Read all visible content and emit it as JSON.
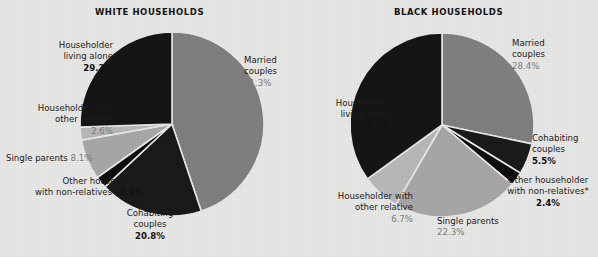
{
  "figure": {
    "footnote_marker": "*"
  },
  "colors": {
    "background": "#e8e8e6",
    "married": "#808080",
    "cohabiting": "#1a1a1a",
    "other_nonrelatives": "#0d0d0d",
    "single_parents": "#a8a8a8",
    "other_relative": "#b9b9b9",
    "living_alone": "#151515",
    "text": "#1c1c1c",
    "muted_text": "#7d7d7d"
  },
  "charts": [
    {
      "id": "white-households",
      "title": "WHITE HOUSEHOLDS",
      "labels": [
        {
          "key": "living-alone",
          "lines": [
            "Householder",
            "living alone"
          ],
          "value": "29.2%",
          "muted": false
        },
        {
          "key": "other-relative",
          "lines": [
            "Householder with",
            "other relative"
          ],
          "value": "2.6%",
          "muted": true
        },
        {
          "key": "single-parents",
          "lines": [
            "Single parents"
          ],
          "value": "8.1%",
          "muted": true,
          "inline": true
        },
        {
          "key": "other-nonrelatives",
          "lines": [
            "Other householder",
            "with non-relatives*"
          ],
          "value": "2.4%",
          "muted": false,
          "inline": true
        },
        {
          "key": "cohabiting",
          "lines": [
            "Cohabiting",
            "couples"
          ],
          "value": "20.8%",
          "muted": false
        },
        {
          "key": "married",
          "lines": [
            "Married",
            "couples"
          ],
          "value": "51.3%",
          "muted": true
        }
      ]
    },
    {
      "id": "black-households",
      "title": "BLACK HOUSEHOLDS",
      "labels": [
        {
          "key": "married",
          "lines": [
            "Married",
            "couples"
          ],
          "value": "28.4%",
          "muted": true
        },
        {
          "key": "cohabiting",
          "lines": [
            "Cohabiting",
            "couples"
          ],
          "value": "5.5%",
          "muted": false
        },
        {
          "key": "other-nonrelatives",
          "lines": [
            "Other householder",
            "with non-relatives*"
          ],
          "value": "2.4%",
          "muted": false
        },
        {
          "key": "single-parents",
          "lines": [
            "Single parents"
          ],
          "value": "22.3%",
          "muted": true
        },
        {
          "key": "other-relative",
          "lines": [
            "Householder with",
            "other relative"
          ],
          "value": "6.7%",
          "muted": true
        },
        {
          "key": "living-alone",
          "lines": [
            "Householder",
            "living alone"
          ],
          "value": "35.1%",
          "muted": false
        }
      ]
    }
  ],
  "chart_data": [
    {
      "type": "pie",
      "title": "WHITE HOUSEHOLDS",
      "categories": [
        "Married couples",
        "Cohabiting couples",
        "Other householder with non-relatives*",
        "Single parents",
        "Householder with other relative",
        "Householder living alone"
      ],
      "values": [
        51.3,
        20.8,
        2.4,
        8.1,
        2.6,
        29.2
      ],
      "value_labels": [
        "51.3%",
        "20.8%",
        "2.4%",
        "8.1%",
        "2.6%",
        "29.2%"
      ],
      "colors": [
        "#808080",
        "#1a1a1a",
        "#0d0d0d",
        "#a8a8a8",
        "#b9b9b9",
        "#151515"
      ],
      "start_angle_deg": 0,
      "direction": "clockwise",
      "legend": "labels-around-pie",
      "grid": false
    },
    {
      "type": "pie",
      "title": "BLACK HOUSEHOLDS",
      "categories": [
        "Married couples",
        "Cohabiting couples",
        "Other householder with non-relatives*",
        "Single parents",
        "Householder with other relative",
        "Householder living alone"
      ],
      "values": [
        28.4,
        5.5,
        2.4,
        22.3,
        6.7,
        35.1
      ],
      "value_labels": [
        "28.4%",
        "5.5%",
        "2.4%",
        "22.3%",
        "6.7%",
        "35.1%"
      ],
      "colors": [
        "#808080",
        "#1a1a1a",
        "#0d0d0d",
        "#a8a8a8",
        "#b9b9b9",
        "#151515"
      ],
      "start_angle_deg": 0,
      "direction": "clockwise",
      "legend": "labels-around-pie",
      "grid": false
    }
  ]
}
